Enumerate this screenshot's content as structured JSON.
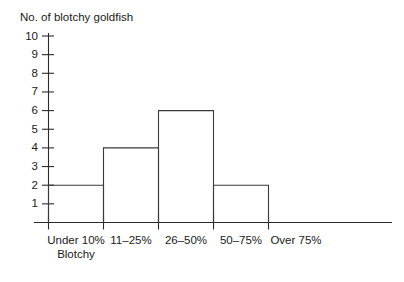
{
  "chart_data": {
    "type": "bar",
    "title": "No. of blotchy goldfish",
    "subtitle": "",
    "xlabel": "",
    "ylabel": "No. of blotchy goldfish",
    "categories": [
      "Under 10%\nBlotchy",
      "11–25%",
      "26–50%",
      "50–75%",
      "Over 75%"
    ],
    "category_lines": [
      [
        "Under 10%",
        "Blotchy"
      ],
      [
        "11–25%"
      ],
      [
        "26–50%"
      ],
      [
        "50–75%"
      ],
      [
        "Over 75%"
      ]
    ],
    "values": [
      2,
      4,
      6,
      2,
      0
    ],
    "ylim": [
      0,
      10
    ],
    "ytick_labels": [
      "1",
      "2",
      "3",
      "4",
      "5",
      "6",
      "7",
      "8",
      "9",
      "10"
    ],
    "ytick_values": [
      1,
      2,
      3,
      4,
      5,
      6,
      7,
      8,
      9,
      10
    ],
    "grid": false,
    "legend": false,
    "legend_position": "none",
    "style": "histogram-outline",
    "colors": {
      "background": "#ffffff",
      "axis": "#2b2b2b",
      "bar_outline": "#3a3a3a",
      "bar_fill": "none",
      "text": "#1a1a1a"
    }
  }
}
